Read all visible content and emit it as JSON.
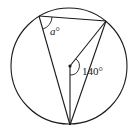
{
  "diagram": {
    "type": "circle-geometry",
    "circle": {
      "cx": 69,
      "cy": 66,
      "r": 58
    },
    "center_point": {
      "x": 70,
      "y": 66
    },
    "vertices": {
      "top_left": {
        "x": 39,
        "y": 16
      },
      "top_right": {
        "x": 106,
        "y": 21
      },
      "bottom": {
        "x": 70,
        "y": 125
      }
    },
    "labels": {
      "inscribed_angle": "a",
      "inscribed_angle_degree": "°",
      "central_angle": "140°"
    },
    "stroke_color": "#1a1a1a"
  }
}
